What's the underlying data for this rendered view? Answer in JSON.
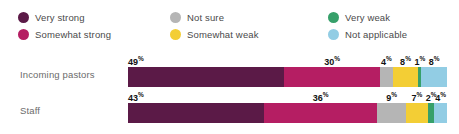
{
  "legend": {
    "items": [
      {
        "label": "Very strong",
        "color": "#5b1a47",
        "icon": "legend-dot-icon"
      },
      {
        "label": "Not sure",
        "color": "#b5b5b5",
        "icon": "legend-dot-icon"
      },
      {
        "label": "Very weak",
        "color": "#36a06a",
        "icon": "legend-dot-icon"
      },
      {
        "label": "Somewhat strong",
        "color": "#b51e63",
        "icon": "legend-dot-icon"
      },
      {
        "label": "Somewhat weak",
        "color": "#f3ce35",
        "icon": "legend-dot-icon"
      },
      {
        "label": "Not applicable",
        "color": "#92cde4",
        "icon": "legend-dot-icon"
      }
    ]
  },
  "chart_data": {
    "type": "bar",
    "title": "",
    "xlabel": "",
    "ylabel": "",
    "orientation": "horizontal",
    "stacked": true,
    "normalized_percent": true,
    "xlim": [
      0,
      100
    ],
    "grid": false,
    "legend_position": "top",
    "categories": [
      "Incoming pastors",
      "Staff"
    ],
    "series": [
      {
        "name": "Very strong",
        "color": "#5b1a47",
        "values": [
          49,
          43
        ]
      },
      {
        "name": "Somewhat strong",
        "color": "#b51e63",
        "values": [
          30,
          36
        ]
      },
      {
        "name": "Not sure",
        "color": "#b5b5b5",
        "values": [
          4,
          9
        ]
      },
      {
        "name": "Somewhat weak",
        "color": "#f3ce35",
        "values": [
          8,
          7
        ]
      },
      {
        "name": "Very weak",
        "color": "#36a06a",
        "values": [
          1,
          2
        ]
      },
      {
        "name": "Not applicable",
        "color": "#92cde4",
        "values": [
          8,
          4
        ]
      }
    ],
    "value_labels": {
      "Incoming pastors": [
        "49%",
        "30%",
        "4%",
        "8%",
        "1%",
        "8%"
      ],
      "Staff": [
        "43%",
        "36%",
        "9%",
        "7%",
        "2%",
        "4%"
      ]
    },
    "percent_symbol": "%"
  }
}
